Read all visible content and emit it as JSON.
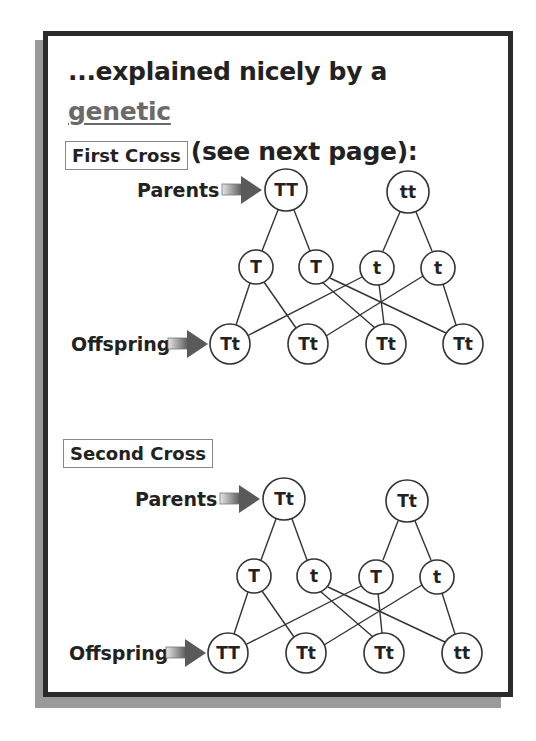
{
  "heading": {
    "prefix": "...explained nicely by a ",
    "key_term_1": "genetic",
    "key_term_2": "diagram",
    "suffix": " (see next page):"
  },
  "crosses": [
    {
      "title": "First Cross",
      "parents_label": "Parents",
      "offspring_label": "Offspring",
      "parents": [
        "TT",
        "tt"
      ],
      "gametes": [
        "T",
        "T",
        "t",
        "t"
      ],
      "offspring": [
        "Tt",
        "Tt",
        "Tt",
        "Tt"
      ]
    },
    {
      "title": "Second Cross",
      "parents_label": "Parents",
      "offspring_label": "Offspring",
      "parents": [
        "Tt",
        "Tt"
      ],
      "gametes": [
        "T",
        "t",
        "T",
        "t"
      ],
      "offspring": [
        "TT",
        "Tt",
        "Tt",
        "tt"
      ]
    }
  ],
  "colors": {
    "frame": "#2b2b2b",
    "shadow": "#9a9a9a",
    "key_term": "#6a6a6a",
    "text": "#222222"
  }
}
